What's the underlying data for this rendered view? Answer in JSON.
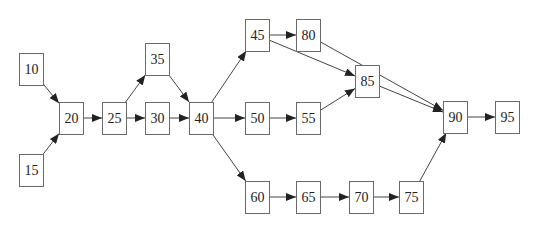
{
  "diagram": {
    "type": "activity-network",
    "colors": {
      "edge": "#444444",
      "border": "#6a6a6a",
      "text": "#222222",
      "background": "#ffffff"
    },
    "nodes": [
      {
        "id": "10",
        "label": "10",
        "x": 19,
        "y": 53
      },
      {
        "id": "15",
        "label": "15",
        "x": 19,
        "y": 154
      },
      {
        "id": "20",
        "label": "20",
        "x": 59,
        "y": 102
      },
      {
        "id": "25",
        "label": "25",
        "x": 102,
        "y": 102
      },
      {
        "id": "30",
        "label": "30",
        "x": 145,
        "y": 102
      },
      {
        "id": "35",
        "label": "35",
        "x": 145,
        "y": 43
      },
      {
        "id": "40",
        "label": "40",
        "x": 189,
        "y": 102
      },
      {
        "id": "45",
        "label": "45",
        "x": 245,
        "y": 19
      },
      {
        "id": "50",
        "label": "50",
        "x": 245,
        "y": 102
      },
      {
        "id": "55",
        "label": "55",
        "x": 296,
        "y": 102
      },
      {
        "id": "60",
        "label": "60",
        "x": 245,
        "y": 181
      },
      {
        "id": "65",
        "label": "65",
        "x": 296,
        "y": 181
      },
      {
        "id": "70",
        "label": "70",
        "x": 349,
        "y": 181
      },
      {
        "id": "75",
        "label": "75",
        "x": 399,
        "y": 181
      },
      {
        "id": "80",
        "label": "80",
        "x": 296,
        "y": 19
      },
      {
        "id": "85",
        "label": "85",
        "x": 355,
        "y": 65
      },
      {
        "id": "90",
        "label": "90",
        "x": 443,
        "y": 101
      },
      {
        "id": "95",
        "label": "95",
        "x": 495,
        "y": 101
      }
    ],
    "edges": [
      {
        "from": "10",
        "to": "20"
      },
      {
        "from": "15",
        "to": "20"
      },
      {
        "from": "20",
        "to": "25"
      },
      {
        "from": "25",
        "to": "35"
      },
      {
        "from": "25",
        "to": "30"
      },
      {
        "from": "35",
        "to": "40"
      },
      {
        "from": "30",
        "to": "40"
      },
      {
        "from": "40",
        "to": "45"
      },
      {
        "from": "40",
        "to": "50"
      },
      {
        "from": "40",
        "to": "60"
      },
      {
        "from": "45",
        "to": "80"
      },
      {
        "from": "45",
        "to": "85"
      },
      {
        "from": "50",
        "to": "55"
      },
      {
        "from": "55",
        "to": "85"
      },
      {
        "from": "60",
        "to": "65"
      },
      {
        "from": "65",
        "to": "70"
      },
      {
        "from": "70",
        "to": "75"
      },
      {
        "from": "80",
        "to": "90"
      },
      {
        "from": "85",
        "to": "90"
      },
      {
        "from": "75",
        "to": "90"
      },
      {
        "from": "90",
        "to": "95"
      }
    ]
  }
}
